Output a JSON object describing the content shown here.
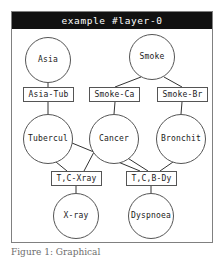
{
  "figure": {
    "title": "example #layer-0",
    "caption": "Figure 1: Graphical",
    "frame_color": "#808080",
    "title_bar_color": "#111111",
    "title_text_color": "#ffffff",
    "node_stroke_color": "#555555",
    "edge_color": "#333333"
  },
  "graph": {
    "type": "factor-graph",
    "variable_nodes": [
      {
        "id": "asia",
        "label": "Asia",
        "shape": "circle",
        "cx": 36,
        "cy": 31,
        "r": 23
      },
      {
        "id": "smoke",
        "label": "Smoke",
        "shape": "circle",
        "cx": 140,
        "cy": 28,
        "r": 23
      },
      {
        "id": "tubercul",
        "label": "Tubercul",
        "shape": "circle",
        "cx": 36,
        "cy": 110,
        "r": 25
      },
      {
        "id": "cancer",
        "label": "Cancer",
        "shape": "circle",
        "cx": 102,
        "cy": 110,
        "r": 25
      },
      {
        "id": "bronchit",
        "label": "Bronchit",
        "shape": "circle",
        "cx": 169,
        "cy": 110,
        "r": 25
      },
      {
        "id": "xray",
        "label": "X-ray",
        "shape": "circle",
        "cx": 64,
        "cy": 187,
        "r": 23
      },
      {
        "id": "dyspnoea",
        "label": "Dyspnoea",
        "shape": "circle",
        "cx": 139,
        "cy": 187,
        "r": 23
      }
    ],
    "factor_nodes": [
      {
        "id": "asia-tub",
        "label": "Asia-Tub",
        "shape": "rect",
        "x": 11,
        "y": 58,
        "w": 51,
        "h": 15
      },
      {
        "id": "smoke-ca",
        "label": "Smoke-Ca",
        "shape": "rect",
        "x": 77,
        "y": 58,
        "w": 51,
        "h": 15
      },
      {
        "id": "smoke-br",
        "label": "Smoke-Br",
        "shape": "rect",
        "x": 145,
        "y": 58,
        "w": 51,
        "h": 15
      },
      {
        "id": "t-c-xray",
        "label": "T,C-Xray",
        "shape": "rect",
        "x": 39,
        "y": 142,
        "w": 51,
        "h": 15
      },
      {
        "id": "t-c-b-dy",
        "label": "T,C,B-Dy",
        "shape": "rect",
        "x": 114,
        "y": 142,
        "w": 51,
        "h": 15
      }
    ],
    "edges": [
      {
        "from": "asia",
        "to": "asia-tub",
        "x1": 36,
        "y1": 54,
        "x2": 36,
        "y2": 58
      },
      {
        "from": "asia-tub",
        "to": "tubercul",
        "x1": 36,
        "y1": 73,
        "x2": 36,
        "y2": 85
      },
      {
        "from": "smoke",
        "to": "smoke-ca",
        "x1": 129,
        "y1": 48,
        "x2": 103,
        "y2": 58
      },
      {
        "from": "smoke",
        "to": "smoke-br",
        "x1": 152,
        "y1": 48,
        "x2": 170,
        "y2": 58
      },
      {
        "from": "smoke-ca",
        "to": "cancer",
        "x1": 103,
        "y1": 73,
        "x2": 102,
        "y2": 85
      },
      {
        "from": "smoke-br",
        "to": "bronchit",
        "x1": 170,
        "y1": 73,
        "x2": 169,
        "y2": 85
      },
      {
        "from": "tubercul",
        "to": "t-c-xray",
        "x1": 44,
        "y1": 133,
        "x2": 55,
        "y2": 142
      },
      {
        "from": "cancer",
        "to": "t-c-xray",
        "x1": 82,
        "y1": 123,
        "x2": 72,
        "y2": 142
      },
      {
        "from": "tubercul",
        "to": "t-c-b-dy",
        "x1": 60,
        "y1": 114,
        "x2": 128,
        "y2": 142
      },
      {
        "from": "cancer",
        "to": "t-c-b-dy",
        "x1": 114,
        "y1": 128,
        "x2": 136,
        "y2": 142
      },
      {
        "from": "bronchit",
        "to": "t-c-b-dy",
        "x1": 161,
        "y1": 133,
        "x2": 148,
        "y2": 142
      },
      {
        "from": "t-c-xray",
        "to": "xray",
        "x1": 64,
        "y1": 157,
        "x2": 64,
        "y2": 164
      },
      {
        "from": "t-c-b-dy",
        "to": "dyspnoea",
        "x1": 139,
        "y1": 157,
        "x2": 139,
        "y2": 164
      }
    ]
  }
}
